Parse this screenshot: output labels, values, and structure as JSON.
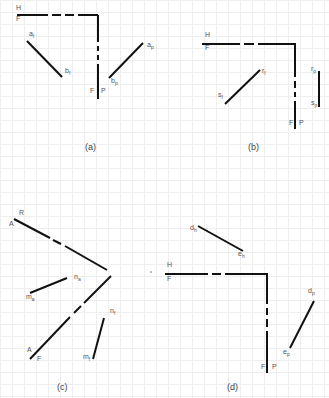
{
  "figure": {
    "panels": [
      {
        "id": "a",
        "caption": "(a)",
        "fold_line_labels": {
          "top_upper": "H",
          "top_lower": "F",
          "side_left": "F",
          "side_right": "P"
        },
        "lines": [
          {
            "name": "ab-front",
            "start_label": "a",
            "start_sub": "f",
            "end_label": "b",
            "end_sub": "f"
          },
          {
            "name": "ab-profile",
            "start_label": "a",
            "start_sub": "p",
            "end_label": "b",
            "end_sub": "p"
          }
        ]
      },
      {
        "id": "b",
        "caption": "(b)",
        "fold_line_labels": {
          "top_upper": "H",
          "top_lower": "F",
          "side_left": "F",
          "side_right": "P"
        },
        "lines": [
          {
            "name": "rs-front",
            "start_label": "r",
            "start_sub": "f",
            "end_label": "s",
            "end_sub": "f"
          },
          {
            "name": "rs-profile",
            "start_label": "r",
            "start_sub": "p",
            "end_label": "s",
            "end_sub": "p"
          }
        ]
      },
      {
        "id": "c",
        "caption": "(c)",
        "fold_line_labels": {
          "upper_top": "R",
          "upper_bottom": "A",
          "lower_top": "A",
          "lower_bottom": "F"
        },
        "lines": [
          {
            "name": "mn-auxiliary",
            "start_label": "n",
            "start_sub": "a",
            "end_label": "m",
            "end_sub": "a"
          },
          {
            "name": "mn-front",
            "start_label": "n",
            "start_sub": "f",
            "end_label": "m",
            "end_sub": "f"
          }
        ]
      },
      {
        "id": "d",
        "caption": "(d)",
        "fold_line_labels": {
          "top_upper": "H",
          "top_lower": "F",
          "side_left": "F",
          "side_right": "P"
        },
        "lines": [
          {
            "name": "de-horizontal",
            "start_label": "d",
            "start_sub": "h",
            "end_label": "e",
            "end_sub": "h"
          },
          {
            "name": "de-profile",
            "start_label": "d",
            "start_sub": "p",
            "end_label": "e",
            "end_sub": "p"
          }
        ]
      }
    ]
  }
}
